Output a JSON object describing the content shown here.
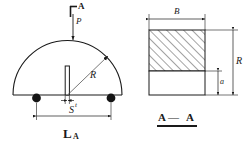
{
  "drawing": {
    "title_visible": false,
    "line_color": "#1a1a1a",
    "hatch_color": "#4a4a4a",
    "support_color": "#141414",
    "background": "#ffffff"
  },
  "left_view": {
    "name": "semicircular-arch-elevation",
    "shape": "semicircle",
    "labels": {
      "section_mark_top": "A",
      "section_mark_top_symbol": "Γ",
      "load": "P",
      "radius": "R",
      "slot_thickness": "t",
      "support_span": "S",
      "section_mark_bottom": "L",
      "section_mark_bottom_sub": "A"
    },
    "supports": [
      {
        "name": "support-left",
        "label": ""
      },
      {
        "name": "support-right",
        "label": ""
      }
    ]
  },
  "right_view": {
    "name": "cross-section-view",
    "labels": {
      "width": "B",
      "height": "R",
      "lower_height": "a",
      "section_title_left": "A",
      "section_title_dash": "—",
      "section_title_right": "A"
    }
  }
}
